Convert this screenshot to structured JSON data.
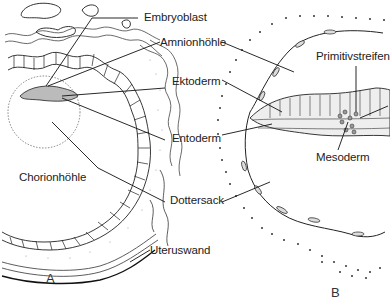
{
  "figure": {
    "panel_a": {
      "letter": "A",
      "labels": {
        "embryoblast": "Embryoblast",
        "amnionhoehle": "Amnionhöhle",
        "ektoderm": "Ektoderm",
        "entoderm": "Entoderm",
        "chorionhoehle": "Chorionhöhle",
        "dottersack": "Dottersack",
        "uteruswand": "Uteruswand"
      }
    },
    "panel_b": {
      "letter": "B",
      "labels": {
        "primitivstreifen": "Primitivstreifen",
        "mesoderm": "Mesoderm"
      }
    },
    "colors": {
      "line": "#222222",
      "dots": "#333333",
      "stipple": "#888888",
      "background": "#ffffff"
    }
  }
}
